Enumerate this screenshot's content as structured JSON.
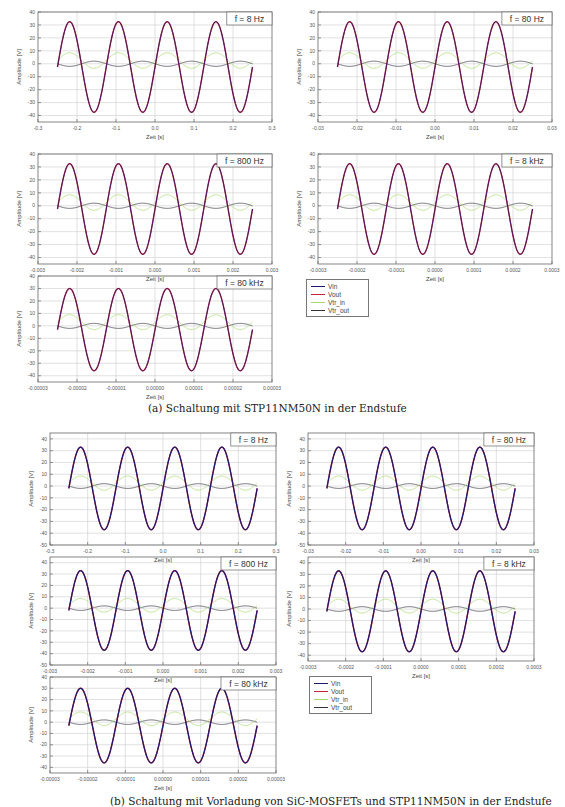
{
  "colors": {
    "Vin": "#1a1a6e",
    "Vout": "#c8203a",
    "Vtr_in": "#a8d86a",
    "Vtr_out": "#333340"
  },
  "figures": [
    {
      "caption": "(a) Schaltung mit STP11NM50N in der Endstufe",
      "legend": [
        "Vin",
        "Vout",
        "Vtr_in",
        "Vtr_out"
      ]
    },
    {
      "caption": "(b) Schaltung mit Vorladung von SiC-MOSFETs und STP11NM50N in der Endstufe",
      "legend": [
        "Vin",
        "Vout",
        "Vtr_in",
        "Vtr_out"
      ]
    }
  ],
  "chart_data": [
    {
      "id": "a1",
      "figure": "a",
      "type": "line",
      "label": "f = 8 Hz",
      "xlabel": "Zeit [s]",
      "ylabel": "Amplitude [V]",
      "xlim": [
        -0.3,
        0.3
      ],
      "ylim": [
        -45,
        40
      ],
      "xticks": [
        "-0.3",
        "-0.2",
        "-0.1",
        "0.0",
        "0.1",
        "0.2",
        "0.3"
      ],
      "yticks": [
        "40",
        "30",
        "20",
        "10",
        "0",
        "-10",
        "-20",
        "-30",
        "-40"
      ],
      "yvals": [
        40,
        30,
        20,
        10,
        0,
        -10,
        -20,
        -30,
        -40
      ],
      "x_range": [
        -0.25,
        0.25
      ],
      "period": 0.125,
      "series": [
        {
          "name": "Vin",
          "amplitude": 35,
          "offset": -2.5
        },
        {
          "name": "Vout",
          "amplitude": 35,
          "offset": -2.5
        },
        {
          "name": "Vtr_in",
          "amplitude": 6,
          "offset": 2.5
        },
        {
          "name": "Vtr_out",
          "amplitude": 2,
          "offset": 0
        }
      ],
      "grid": true
    },
    {
      "id": "a2",
      "figure": "a",
      "type": "line",
      "label": "f = 80 Hz",
      "xlabel": "Zeit [s]",
      "ylabel": "Amplitude [V]",
      "xlim": [
        -0.03,
        0.03
      ],
      "ylim": [
        -45,
        40
      ],
      "xticks": [
        "-0.03",
        "-0.02",
        "-0.01",
        "0.00",
        "0.01",
        "0.02",
        "0.03"
      ],
      "yticks": [
        "40",
        "30",
        "20",
        "10",
        "0",
        "-10",
        "-20",
        "-30",
        "-40"
      ],
      "yvals": [
        40,
        30,
        20,
        10,
        0,
        -10,
        -20,
        -30,
        -40
      ],
      "x_range": [
        -0.025,
        0.025
      ],
      "period": 0.0125,
      "series": [
        {
          "name": "Vin",
          "amplitude": 35,
          "offset": -2.5
        },
        {
          "name": "Vout",
          "amplitude": 35,
          "offset": -2.5
        },
        {
          "name": "Vtr_in",
          "amplitude": 6,
          "offset": 2.5
        },
        {
          "name": "Vtr_out",
          "amplitude": 2,
          "offset": 0
        }
      ],
      "grid": true
    },
    {
      "id": "a3",
      "figure": "a",
      "type": "line",
      "label": "f = 800 Hz",
      "xlabel": "Zeit [s]",
      "ylabel": "Amplitude [V]",
      "xlim": [
        -0.003,
        0.003
      ],
      "ylim": [
        -45,
        40
      ],
      "xticks": [
        "-0.003",
        "-0.002",
        "-0.001",
        "0.000",
        "0.001",
        "0.002",
        "0.003"
      ],
      "yticks": [
        "40",
        "30",
        "20",
        "10",
        "0",
        "-10",
        "-20",
        "-30",
        "-40"
      ],
      "yvals": [
        40,
        30,
        20,
        10,
        0,
        -10,
        -20,
        -30,
        -40
      ],
      "x_range": [
        -0.0025,
        0.0025
      ],
      "period": 0.00125,
      "series": [
        {
          "name": "Vin",
          "amplitude": 35,
          "offset": -2.5
        },
        {
          "name": "Vout",
          "amplitude": 35,
          "offset": -2.5
        },
        {
          "name": "Vtr_in",
          "amplitude": 6,
          "offset": 2.5
        },
        {
          "name": "Vtr_out",
          "amplitude": 2,
          "offset": 0
        }
      ],
      "grid": true
    },
    {
      "id": "a4",
      "figure": "a",
      "type": "line",
      "label": "f = 8 kHz",
      "xlabel": "Zeit [s]",
      "ylabel": "Amplitude [V]",
      "xlim": [
        -0.0003,
        0.0003
      ],
      "ylim": [
        -45,
        40
      ],
      "xticks": [
        "-0.0003",
        "-0.0002",
        "-0.0001",
        "0.0000",
        "0.0001",
        "0.0002",
        "0.0003"
      ],
      "yticks": [
        "40",
        "30",
        "20",
        "10",
        "0",
        "-10",
        "-20",
        "-30",
        "-40"
      ],
      "yvals": [
        40,
        30,
        20,
        10,
        0,
        -10,
        -20,
        -30,
        -40
      ],
      "x_range": [
        -0.00025,
        0.00025
      ],
      "period": 0.000125,
      "series": [
        {
          "name": "Vin",
          "amplitude": 35,
          "offset": -2.5
        },
        {
          "name": "Vout",
          "amplitude": 35,
          "offset": -2.5
        },
        {
          "name": "Vtr_in",
          "amplitude": 6,
          "offset": 2.5
        },
        {
          "name": "Vtr_out",
          "amplitude": 2,
          "offset": 0
        }
      ],
      "grid": true
    },
    {
      "id": "a5",
      "figure": "a",
      "type": "line",
      "label": "f = 80 kHz",
      "xlabel": "Zeit [s]",
      "ylabel": "Amplitude [V]",
      "xlim": [
        -3e-05,
        3e-05
      ],
      "ylim": [
        -45,
        40
      ],
      "xticks": [
        "-0.00003",
        "-0.00002",
        "-0.00001",
        "0.00000",
        "0.00001",
        "0.00002",
        "0.00003"
      ],
      "yticks": [
        "40",
        "30",
        "20",
        "10",
        "0",
        "-10",
        "-20",
        "-30",
        "-40"
      ],
      "yvals": [
        40,
        30,
        20,
        10,
        0,
        -10,
        -20,
        -30,
        -40
      ],
      "x_range": [
        -2.5e-05,
        2.5e-05
      ],
      "period": 1.25e-05,
      "series": [
        {
          "name": "Vin",
          "amplitude": 33,
          "offset": -3
        },
        {
          "name": "Vout",
          "amplitude": 33,
          "offset": -3
        },
        {
          "name": "Vtr_in",
          "amplitude": 6,
          "offset": 3
        },
        {
          "name": "Vtr_out",
          "amplitude": 2,
          "offset": 0
        }
      ],
      "grid": true
    },
    {
      "id": "b1",
      "figure": "b",
      "type": "line",
      "label": "f = 8 Hz",
      "xlabel": "Zeit [s]",
      "ylabel": "Amplitude [V]",
      "xlim": [
        -0.3,
        0.3
      ],
      "ylim": [
        -50,
        45
      ],
      "xticks": [
        "-0.3",
        "-0.2",
        "-0.1",
        "0.0",
        "0.1",
        "0.2",
        "0.3"
      ],
      "yticks": [
        "40",
        "30",
        "20",
        "10",
        "0",
        "-10",
        "-20",
        "-30",
        "-40",
        "-50"
      ],
      "yvals": [
        40,
        30,
        20,
        10,
        0,
        -10,
        -20,
        -30,
        -40,
        -50
      ],
      "x_range": [
        -0.25,
        0.25
      ],
      "period": 0.125,
      "series": [
        {
          "name": "Vin",
          "amplitude": 35,
          "offset": -2
        },
        {
          "name": "Vout",
          "amplitude": 35,
          "offset": -2
        },
        {
          "name": "Vtr_in",
          "amplitude": 6,
          "offset": 2.5
        },
        {
          "name": "Vtr_out",
          "amplitude": 2,
          "offset": 0
        }
      ],
      "grid": true
    },
    {
      "id": "b2",
      "figure": "b",
      "type": "line",
      "label": "f = 80 Hz",
      "xlabel": "Zeit [s]",
      "ylabel": "Amplitude [V]",
      "xlim": [
        -0.03,
        0.03
      ],
      "ylim": [
        -50,
        45
      ],
      "xticks": [
        "-0.03",
        "-0.02",
        "-0.01",
        "0.00",
        "0.01",
        "0.02",
        "0.03"
      ],
      "yticks": [
        "40",
        "30",
        "20",
        "10",
        "0",
        "-10",
        "-20",
        "-30",
        "-40",
        "-50"
      ],
      "yvals": [
        40,
        30,
        20,
        10,
        0,
        -10,
        -20,
        -30,
        -40,
        -50
      ],
      "x_range": [
        -0.025,
        0.025
      ],
      "period": 0.0125,
      "series": [
        {
          "name": "Vin",
          "amplitude": 35,
          "offset": -2
        },
        {
          "name": "Vout",
          "amplitude": 35,
          "offset": -2
        },
        {
          "name": "Vtr_in",
          "amplitude": 6,
          "offset": 2.5
        },
        {
          "name": "Vtr_out",
          "amplitude": 2,
          "offset": 0
        }
      ],
      "grid": true
    },
    {
      "id": "b3",
      "figure": "b",
      "type": "line",
      "label": "f = 800 Hz",
      "xlabel": "Zeit [s]",
      "ylabel": "Amplitude [V]",
      "xlim": [
        -0.003,
        0.003
      ],
      "ylim": [
        -50,
        45
      ],
      "xticks": [
        "-0.003",
        "-0.002",
        "-0.001",
        "0.000",
        "0.001",
        "0.002",
        "0.003"
      ],
      "yticks": [
        "40",
        "30",
        "20",
        "10",
        "0",
        "-10",
        "-20",
        "-30",
        "-40",
        "-50"
      ],
      "yvals": [
        40,
        30,
        20,
        10,
        0,
        -10,
        -20,
        -30,
        -40,
        -50
      ],
      "x_range": [
        -0.0025,
        0.0025
      ],
      "period": 0.00125,
      "series": [
        {
          "name": "Vin",
          "amplitude": 35,
          "offset": -2
        },
        {
          "name": "Vout",
          "amplitude": 35,
          "offset": -2
        },
        {
          "name": "Vtr_in",
          "amplitude": 6,
          "offset": 2.5
        },
        {
          "name": "Vtr_out",
          "amplitude": 2,
          "offset": 0
        }
      ],
      "grid": true
    },
    {
      "id": "b4",
      "figure": "b",
      "type": "line",
      "label": "f = 8 kHz",
      "xlabel": "Zeit [s]",
      "ylabel": "Amplitude [V]",
      "xlim": [
        -0.0003,
        0.0003
      ],
      "ylim": [
        -45,
        45
      ],
      "xticks": [
        "-0.0003",
        "-0.0002",
        "-0.0001",
        "0.0000",
        "0.0001",
        "0.0002",
        "0.0003"
      ],
      "yticks": [
        "40",
        "30",
        "20",
        "10",
        "0",
        "-10",
        "-20",
        "-30",
        "-40"
      ],
      "yvals": [
        40,
        30,
        20,
        10,
        0,
        -10,
        -20,
        -30,
        -40
      ],
      "x_range": [
        -0.00025,
        0.00025
      ],
      "period": 0.000125,
      "series": [
        {
          "name": "Vin",
          "amplitude": 35,
          "offset": -2
        },
        {
          "name": "Vout",
          "amplitude": 35,
          "offset": -2
        },
        {
          "name": "Vtr_in",
          "amplitude": 6,
          "offset": 2.5
        },
        {
          "name": "Vtr_out",
          "amplitude": 2,
          "offset": 0
        }
      ],
      "grid": true
    },
    {
      "id": "b5",
      "figure": "b",
      "type": "line",
      "label": "f = 80 kHz",
      "xlabel": "Zeit [s]",
      "ylabel": "Amplitude [V]",
      "xlim": [
        -3e-05,
        3e-05
      ],
      "ylim": [
        -45,
        40
      ],
      "xticks": [
        "-0.00003",
        "-0.00002",
        "-0.00001",
        "0.00000",
        "0.00001",
        "0.00002",
        "0.00003"
      ],
      "yticks": [
        "40",
        "30",
        "20",
        "10",
        "0",
        "-10",
        "-20",
        "-30",
        "-40"
      ],
      "yvals": [
        40,
        30,
        20,
        10,
        0,
        -10,
        -20,
        -30,
        -40
      ],
      "x_range": [
        -2.5e-05,
        2.5e-05
      ],
      "period": 1.25e-05,
      "series": [
        {
          "name": "Vin",
          "amplitude": 33,
          "offset": -3
        },
        {
          "name": "Vout",
          "amplitude": 33,
          "offset": -3
        },
        {
          "name": "Vtr_in",
          "amplitude": 6,
          "offset": 3
        },
        {
          "name": "Vtr_out",
          "amplitude": 2,
          "offset": 0
        }
      ],
      "grid": true
    }
  ]
}
